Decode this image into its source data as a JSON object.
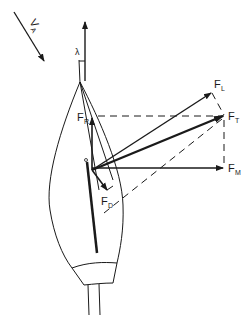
{
  "diagram": {
    "labels": {
      "apparent_wind": {
        "main": "V",
        "sub": "A"
      },
      "leeway_angle": "λ",
      "lift": {
        "main": "F",
        "sub": "L"
      },
      "total": {
        "main": "F",
        "sub": "T"
      },
      "heeling_lateral": {
        "main": "F",
        "sub": "M"
      },
      "driving": {
        "main": "F",
        "sub": "R"
      },
      "drag": {
        "main": "F",
        "sub": "D"
      }
    },
    "colors": {
      "ink": "#1a1a1a",
      "background": "#ffffff"
    }
  }
}
